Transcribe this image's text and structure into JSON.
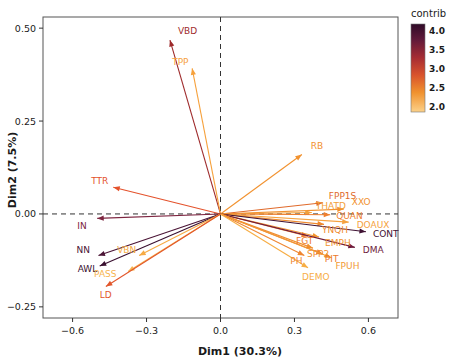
{
  "chart_data": {
    "type": "scatter",
    "subtype": "pca-variable-correlation-biplot",
    "title": "",
    "xlabel": "Dim1 (30.3%)",
    "ylabel": "Dim2 (7.5%)",
    "xlim": [
      -0.72,
      0.72
    ],
    "ylim": [
      -0.28,
      0.53
    ],
    "xticks": [
      -0.6,
      -0.3,
      0.0,
      0.3,
      0.6
    ],
    "xticklabels": [
      "−0.6",
      "−0.3",
      "0.0",
      "0.3",
      "0.6"
    ],
    "yticks": [
      -0.25,
      0.0,
      0.25,
      0.5
    ],
    "yticklabels": [
      "−0.25",
      "0.00",
      "0.25",
      "0.50"
    ],
    "grid": false,
    "zero_lines": true,
    "origin": [
      0.0,
      0.0
    ],
    "legend": {
      "title": "contrib",
      "position": "right",
      "type": "colorbar",
      "ticks": [
        4.0,
        3.5,
        3.0,
        2.5,
        2.0
      ],
      "ticklabels": [
        "4.0",
        "3.5",
        "3.0",
        "2.5",
        "2.0"
      ],
      "colors_high_to_low": [
        "#3b0f2e",
        "#7b1f3a",
        "#b8352f",
        "#e2622c",
        "#f5a93f",
        "#fdd08a"
      ]
    },
    "arrows": [
      {
        "name": "VBD",
        "x": -0.205,
        "y": 0.468,
        "contrib": 3.7,
        "color": "#9e2a2b",
        "label_dx": 8,
        "label_dy": -6
      },
      {
        "name": "TPP",
        "x": -0.115,
        "y": 0.392,
        "contrib": 2.2,
        "color": "#f6a13c",
        "label_dx": -20,
        "label_dy": -3
      },
      {
        "name": "RB",
        "x": 0.33,
        "y": 0.16,
        "contrib": 2.4,
        "color": "#f2922f",
        "label_dx": 9,
        "label_dy": -5
      },
      {
        "name": "TTR",
        "x": -0.435,
        "y": 0.072,
        "contrib": 2.9,
        "color": "#e4522c",
        "label_dx": -22,
        "label_dy": -3
      },
      {
        "name": "FPP1S",
        "x": 0.415,
        "y": 0.03,
        "contrib": 2.8,
        "color": "#e06a2b",
        "label_dx": 6,
        "label_dy": -4
      },
      {
        "name": "XXO",
        "x": 0.5,
        "y": 0.013,
        "contrib": 2.3,
        "color": "#f19230",
        "label_dx": 8,
        "label_dy": -4
      },
      {
        "name": "THATD",
        "x": 0.37,
        "y": 0.004,
        "contrib": 2.3,
        "color": "#f2a03a",
        "label_dx": 4,
        "label_dy": -3
      },
      {
        "name": "QUAN",
        "x": 0.445,
        "y": -0.002,
        "contrib": 2.6,
        "color": "#ef7f2d",
        "label_dx": 6,
        "label_dy": 4
      },
      {
        "name": "DOAUX",
        "x": 0.52,
        "y": -0.022,
        "contrib": 2.2,
        "color": "#f5a240",
        "label_dx": 8,
        "label_dy": 6
      },
      {
        "name": "YNQH",
        "x": 0.42,
        "y": -0.028,
        "contrib": 2.5,
        "color": "#ef8a2e",
        "label_dx": -2,
        "label_dy": 9
      },
      {
        "name": "CONT",
        "x": 0.59,
        "y": -0.048,
        "contrib": 4.0,
        "color": "#3f1233",
        "label_dx": 7,
        "label_dy": 5
      },
      {
        "name": "EMPH",
        "x": 0.4,
        "y": -0.062,
        "contrib": 2.4,
        "color": "#f2952f",
        "label_dx": 6,
        "label_dy": 9
      },
      {
        "name": "FGT",
        "x": 0.355,
        "y": -0.06,
        "contrib": 2.6,
        "color": "#ed7a2c",
        "label_dx": -12,
        "label_dy": 8
      },
      {
        "name": "DMA",
        "x": 0.545,
        "y": -0.09,
        "contrib": 3.5,
        "color": "#6d1b3c",
        "label_dx": 8,
        "label_dy": 6
      },
      {
        "name": "SPP2",
        "x": 0.375,
        "y": -0.092,
        "contrib": 2.4,
        "color": "#f0902f",
        "label_dx": -6,
        "label_dy": 9
      },
      {
        "name": "PIT",
        "x": 0.415,
        "y": -0.108,
        "contrib": 2.6,
        "color": "#ec7a2c",
        "label_dx": 2,
        "label_dy": 8
      },
      {
        "name": "FPUH",
        "x": 0.45,
        "y": -0.118,
        "contrib": 2.3,
        "color": "#f29a34",
        "label_dx": 4,
        "label_dy": 11
      },
      {
        "name": "PH",
        "x": 0.34,
        "y": -0.112,
        "contrib": 2.5,
        "color": "#ef8630",
        "label_dx": -14,
        "label_dy": 8
      },
      {
        "name": "DEMO",
        "x": 0.355,
        "y": -0.145,
        "contrib": 2.2,
        "color": "#f7ad44",
        "label_dx": -6,
        "label_dy": 12
      },
      {
        "name": "IN",
        "x": -0.5,
        "y": -0.012,
        "contrib": 3.3,
        "color": "#7d2540",
        "label_dx": -20,
        "label_dy": 11
      },
      {
        "name": "NN",
        "x": -0.495,
        "y": -0.112,
        "contrib": 3.6,
        "color": "#4b1536",
        "label_dx": -22,
        "label_dy": -3
      },
      {
        "name": "AWL",
        "x": -0.49,
        "y": -0.14,
        "contrib": 3.8,
        "color": "#3a1030",
        "label_dx": -22,
        "label_dy": 6
      },
      {
        "name": "VBN",
        "x": -0.33,
        "y": -0.112,
        "contrib": 2.2,
        "color": "#f6ab44",
        "label_dx": -22,
        "label_dy": -3
      },
      {
        "name": "PASS",
        "x": -0.375,
        "y": -0.155,
        "contrib": 2.2,
        "color": "#f7b44e",
        "label_dx": -34,
        "label_dy": 5
      },
      {
        "name": "LD",
        "x": -0.465,
        "y": -0.195,
        "contrib": 2.8,
        "color": "#e2562b",
        "label_dx": -6,
        "label_dy": 12
      }
    ]
  },
  "axes": {
    "x_title": "Dim1 (30.3%)",
    "y_title": "Dim2 (7.5%)"
  },
  "legend": {
    "title": "contrib",
    "labels": [
      "4.0",
      "3.5",
      "3.0",
      "2.5",
      "2.0"
    ]
  }
}
